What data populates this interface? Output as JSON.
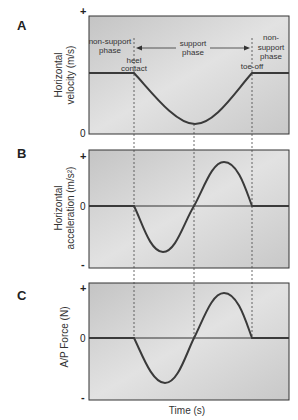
{
  "figure": {
    "x_axis_label": "Time (s)",
    "phases": {
      "left": "non-support phase",
      "middle": "support phase",
      "right": "non-support phase"
    },
    "events": {
      "heel_contact": "heel contact",
      "toe_off": "toe-off"
    },
    "panels": [
      {
        "letter": "A",
        "ylabel_line1": "Horizontal",
        "ylabel_line2": "velocity (m/s)",
        "ticks": {
          "top": "+",
          "zero": "0"
        }
      },
      {
        "letter": "B",
        "ylabel_line1": "Horizontal",
        "ylabel_line2": "acceleration (m/s²)",
        "ticks": {
          "top": "+",
          "zero": "0",
          "bottom": "-"
        }
      },
      {
        "letter": "C",
        "ylabel_line1": "A/P Force (N)",
        "ticks": {
          "top": "+",
          "zero": "0",
          "bottom": "-"
        }
      }
    ],
    "annotations": {
      "left_phase_line1": "non-support",
      "left_phase_line2": "phase",
      "heel_line1": "heel",
      "heel_line2": "contact",
      "middle_phase_line1": "support",
      "middle_phase_line2": "phase",
      "right_phase_line1": "non-",
      "right_phase_line2": "support",
      "right_phase_line3": "phase",
      "toe_off": "toe-off"
    },
    "colors": {
      "panel_fill": "#c9c9c9",
      "panel_fill_light": "#dedede",
      "curve": "#3a3a3a",
      "border": "#333333"
    }
  }
}
